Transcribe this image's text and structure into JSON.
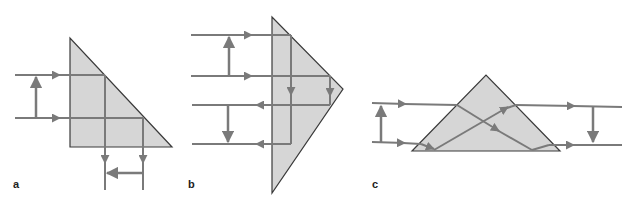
{
  "colors": {
    "prism_fill": "#d6d6d6",
    "prism_stroke": "#3a3a3a",
    "ray": "#7a7a7a",
    "background": "#ffffff"
  },
  "panels": [
    {
      "label": "a",
      "description": "Right-angle prism, 90-degree deflection (rays reflected downward, image reversed)",
      "prism": [
        [
          70,
          38
        ],
        [
          70,
          147
        ],
        [
          172,
          147
        ]
      ],
      "label_pos": [
        12,
        187
      ]
    },
    {
      "label": "b",
      "description": "Right-angle prism used as retroreflector (Porro), rays returned, order inverted",
      "prism": [
        [
          272,
          17
        ],
        [
          272,
          193
        ],
        [
          343,
          89
        ]
      ],
      "label_pos": [
        187,
        187
      ]
    },
    {
      "label": "c",
      "description": "Dove prism, rays transmitted with inversion",
      "prism": [
        [
          412,
          151
        ],
        [
          486,
          75
        ],
        [
          560,
          151
        ]
      ],
      "label_pos": [
        372,
        187
      ]
    }
  ]
}
